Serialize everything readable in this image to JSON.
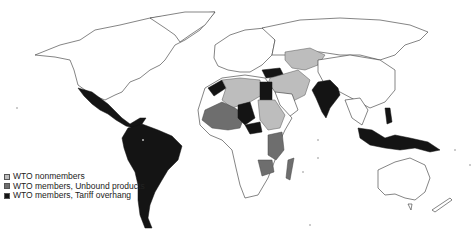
{
  "figure": {
    "type": "choropleth-world-map",
    "legend": {
      "items": [
        {
          "label": "WTO nonmembers",
          "color": "#bdbdbd"
        },
        {
          "label": "WTO members, Unbound products",
          "color": "#6e6e6e"
        },
        {
          "label": "WTO members, Tariff overhang",
          "color": "#141414"
        }
      ]
    },
    "regions": {
      "tariff_overhang": [
        "Mexico",
        "Central America",
        "South America",
        "Turkey",
        "Egypt",
        "India",
        "Indonesia",
        "Papua New Guinea",
        "Philippines",
        "Morocco",
        "Nigeria",
        "Chad"
      ],
      "unbound_products": [
        "West Africa",
        "Mali",
        "Niger",
        "Tanzania",
        "Mozambique",
        "Madagascar",
        "Zambia"
      ],
      "nonmembers": [
        "Algeria",
        "Libya",
        "Sudan",
        "Ethiopia",
        "Russia-adjacent Central Asia",
        "Kazakhstan",
        "Iran",
        "Saudi Arabia",
        "Iraq"
      ]
    }
  }
}
